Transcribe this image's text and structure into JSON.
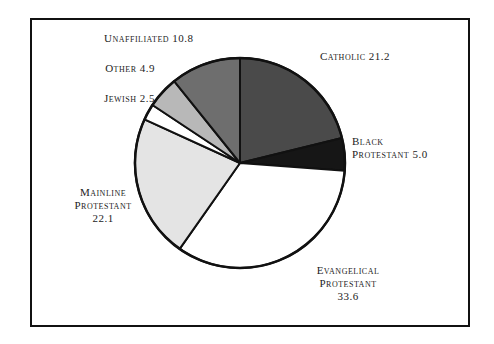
{
  "chart_data": {
    "type": "pie",
    "title": "",
    "subtitle": "",
    "xlabel": "",
    "ylabel": "",
    "legend_position": "none",
    "grid": false,
    "labels_inline": true,
    "start_angle_deg": 0,
    "direction": "clockwise",
    "categories": [
      "Catholic",
      "Black Protestant",
      "Evangelical Protestant",
      "Mainline Protestant",
      "Jewish",
      "Other",
      "Unaffiliated"
    ],
    "values": [
      21.2,
      5.0,
      33.6,
      22.1,
      2.5,
      4.9,
      10.8
    ],
    "total": 100.1,
    "slices": [
      {
        "name": "Catholic",
        "value": 21.2,
        "value_text": "21.2",
        "label_text": "Catholic 21.2",
        "color": "#4a4a4a"
      },
      {
        "name": "Black Protestant",
        "value": 5.0,
        "value_text": "5.0",
        "label_text": "Black\nProtestant 5.0",
        "color": "#161616"
      },
      {
        "name": "Evangelical Protestant",
        "value": 33.6,
        "value_text": "33.6",
        "label_text": "Evangelical\nProtestant\n33.6",
        "color": "#ffffff"
      },
      {
        "name": "Mainline Protestant",
        "value": 22.1,
        "value_text": "22.1",
        "label_text": "Mainline\nProtestant\n22.1",
        "color": "#e4e4e4"
      },
      {
        "name": "Jewish",
        "value": 2.5,
        "value_text": "2.5",
        "label_text": "Jewish 2.5",
        "color": "#ffffff"
      },
      {
        "name": "Other",
        "value": 4.9,
        "value_text": "4.9",
        "label_text": "Other 4.9",
        "color": "#b8b8b8"
      },
      {
        "name": "Unaffiliated",
        "value": 10.8,
        "value_text": "10.8",
        "label_text": "Unaffiliated 10.8",
        "color": "#6e6e6e"
      }
    ]
  },
  "style": {
    "stroke_color": "#111111",
    "frame_color": "#111111",
    "background": "#ffffff",
    "text_color": "#1c1c1c"
  },
  "geometry": {
    "center_x": 240,
    "center_y": 163,
    "radius": 105
  }
}
